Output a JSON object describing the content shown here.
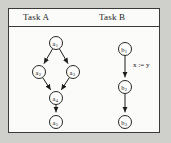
{
  "figure": {
    "background_color": "#cfcfcb",
    "panel_color": "#fbfbfa",
    "border_color": "#3a3a3a",
    "node_stroke_color": "#262626",
    "edge_color": "#1c1c1c"
  },
  "columns": [
    {
      "id": "task-a",
      "title": "Task A"
    },
    {
      "id": "task-b",
      "title": "Task B"
    }
  ],
  "graphs": {
    "task_a": {
      "nodes": [
        {
          "id": "a1",
          "base": "a",
          "sub": "1",
          "cx": 47,
          "cy": 16,
          "r": 6.5
        },
        {
          "id": "a2",
          "base": "a",
          "sub": "2",
          "cx": 30,
          "cy": 45,
          "r": 6.5
        },
        {
          "id": "a3",
          "base": "a",
          "sub": "3",
          "cx": 64,
          "cy": 45,
          "r": 6.5
        },
        {
          "id": "a4",
          "base": "a",
          "sub": "4",
          "cx": 47,
          "cy": 71,
          "r": 6.5
        },
        {
          "id": "a5",
          "base": "a",
          "sub": "5",
          "cx": 47,
          "cy": 95,
          "r": 6.5
        }
      ],
      "edges": [
        {
          "from": "a1",
          "to": "a2",
          "label": ""
        },
        {
          "from": "a1",
          "to": "a3",
          "label": ""
        },
        {
          "from": "a2",
          "to": "a4",
          "label": ""
        },
        {
          "from": "a3",
          "to": "a4",
          "label": ""
        },
        {
          "from": "a4",
          "to": "a5",
          "label": ""
        }
      ]
    },
    "task_b": {
      "nodes": [
        {
          "id": "b1",
          "base": "b",
          "sub": "1",
          "cx": 116,
          "cy": 22,
          "r": 6.5
        },
        {
          "id": "b2",
          "base": "b",
          "sub": "2",
          "cx": 116,
          "cy": 60,
          "r": 6.5
        },
        {
          "id": "b3",
          "base": "b",
          "sub": "3",
          "cx": 116,
          "cy": 95,
          "r": 6.5
        }
      ],
      "edges": [
        {
          "from": "b1",
          "to": "b2",
          "label": "x := y",
          "label_x": 124,
          "label_y": 40
        },
        {
          "from": "b2",
          "to": "b3",
          "label": ""
        }
      ]
    }
  }
}
